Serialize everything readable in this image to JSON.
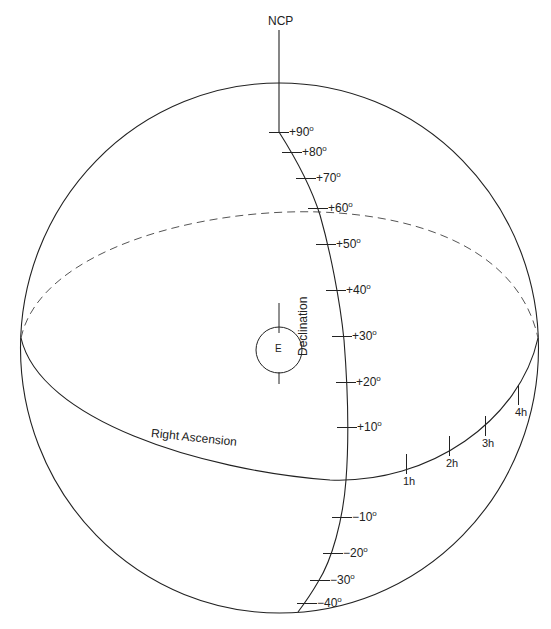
{
  "diagram": {
    "title_pole": "NCP",
    "center_label": "E",
    "declination_axis_label": "Declination",
    "ra_axis_label": "Right Ascension",
    "degree_symbol": "o",
    "declination_ticks": [
      {
        "label": "+90",
        "x": 279,
        "y": 132
      },
      {
        "label": "+80",
        "x": 292,
        "y": 152
      },
      {
        "label": "+70",
        "x": 306,
        "y": 178
      },
      {
        "label": "+60",
        "x": 318,
        "y": 208
      },
      {
        "label": "+50",
        "x": 326,
        "y": 244
      },
      {
        "label": "+40",
        "x": 336,
        "y": 290
      },
      {
        "label": "+30",
        "x": 342,
        "y": 336
      },
      {
        "label": "+20",
        "x": 346,
        "y": 382
      },
      {
        "label": "+10",
        "x": 347,
        "y": 427
      },
      {
        "label": "-10",
        "x": 342,
        "y": 517
      },
      {
        "label": "-20",
        "x": 333,
        "y": 553
      },
      {
        "label": "-30",
        "x": 320,
        "y": 580
      },
      {
        "label": "-40",
        "x": 307,
        "y": 603
      }
    ],
    "ra_ticks": [
      {
        "label": "1h",
        "x": 406,
        "y": 464
      },
      {
        "label": "2h",
        "x": 449,
        "y": 446
      },
      {
        "label": "3h",
        "x": 485,
        "y": 426
      },
      {
        "label": "4h",
        "x": 518,
        "y": 395
      }
    ],
    "colors": {
      "line": "#222222",
      "dashed": "#555555",
      "background": "#ffffff"
    }
  }
}
